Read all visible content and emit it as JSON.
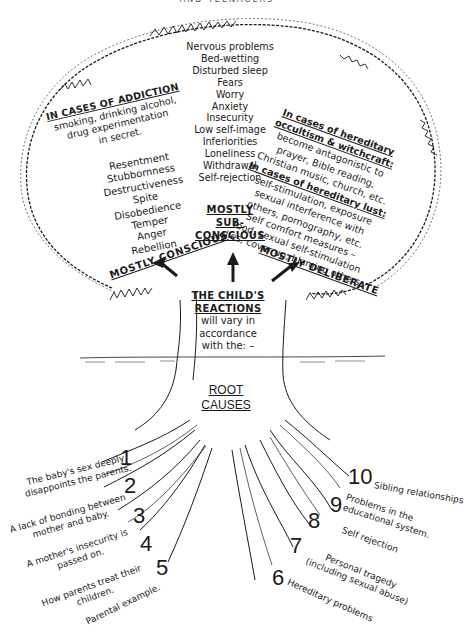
{
  "header": {
    "title_truncated": "AND TEENAGERS"
  },
  "crown": {
    "center_list": [
      "Nervous problems",
      "Bed-wetting",
      "Disturbed sleep",
      "Fears",
      "Worry",
      "Anxiety",
      "Insecurity",
      "Low self-image",
      "Inferiorities",
      "Loneliness",
      "Withdrawal",
      "Self-rejection"
    ],
    "addiction": {
      "title": "IN CASES OF ADDICTION",
      "lines": [
        "smoking, drinking alcohol,",
        "drug experimentation",
        "in secret."
      ]
    },
    "left_list": [
      "Resentment",
      "Stubbornness",
      "Destructiveness",
      "Spite",
      "Disobedience",
      "Temper",
      "Anger",
      "Rebellion"
    ],
    "occult": {
      "title_1": "In cases of hereditary",
      "title_2": "occultism & witchcraft:",
      "lines": [
        "become antagonistic to",
        "prayer, Bible reading,",
        "Christian music, church, etc."
      ]
    },
    "lust": {
      "title": "In cases of hereditary lust:",
      "lines": [
        "self-stimulation, exposure",
        "sexual interference with",
        "others, pornography, etc."
      ]
    },
    "comfort": {
      "lines": [
        "Self comfort measures –",
        "food, sexual self-stimulation",
        "lies, cover up, blaming others"
      ]
    }
  },
  "categories": {
    "conscious": "MOSTLY CONSCIOUS",
    "sub_conscious_1": "MOSTLY",
    "sub_conscious_2": "SUB-CONSCIOUS",
    "deliberate": "MOSTLY DELIBERATE"
  },
  "trunk": {
    "title_1": "THE CHILD'S",
    "title_2": "REACTIONS",
    "lines": [
      "will vary in",
      "accordance",
      "with the: –"
    ]
  },
  "roots": {
    "title_1": "ROOT",
    "title_2": "CAUSES",
    "causes": [
      {
        "num": "1",
        "text_1": "The baby's sex deeply",
        "text_2": "disappoints the parents."
      },
      {
        "num": "2",
        "text_1": "A lack of bonding between",
        "text_2": "mother and baby."
      },
      {
        "num": "3",
        "text_1": "A mother's insecurity is",
        "text_2": "passed on."
      },
      {
        "num": "4",
        "text_1": "How parents treat their",
        "text_2": "children."
      },
      {
        "num": "5",
        "text_1": "Parental example.",
        "text_2": ""
      },
      {
        "num": "6",
        "text_1": "Hereditary problems",
        "text_2": ""
      },
      {
        "num": "7",
        "text_1": "Personal tragedy",
        "text_2": "(including sexual abuse)"
      },
      {
        "num": "8",
        "text_1": "Self rejection",
        "text_2": ""
      },
      {
        "num": "9",
        "text_1": "Problems in the",
        "text_2": "educational system."
      },
      {
        "num": "10",
        "text_1": "Sibling relationships",
        "text_2": ""
      }
    ]
  },
  "colors": {
    "ink": "#1a1a1a",
    "paper": "#ffffff"
  }
}
